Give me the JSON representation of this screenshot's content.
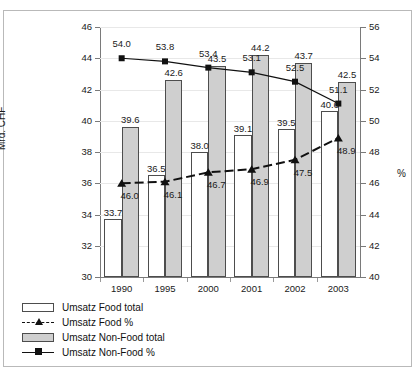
{
  "chart_data": {
    "type": "bar",
    "title": "",
    "subtitle": "",
    "categories": [
      "1990",
      "1995",
      "2000",
      "2001",
      "2002",
      "2003"
    ],
    "xlabel": "",
    "ylabel": "Mrd. CHF",
    "ylabel_right": "%",
    "ylim": [
      30,
      46
    ],
    "ylim_right": [
      40,
      56
    ],
    "yticks": [
      30,
      32,
      34,
      36,
      38,
      40,
      42,
      44,
      46
    ],
    "yticks_right": [
      40,
      42,
      44,
      46,
      48,
      50,
      52,
      54,
      56
    ],
    "grid": true,
    "legend_position": "below",
    "series": [
      {
        "name": "Umsatz Food total",
        "kind": "bar",
        "axis": "left",
        "fill": "#ffffff",
        "values": [
          33.7,
          36.5,
          38.0,
          39.1,
          39.5,
          40.6
        ],
        "labels": [
          "33.7",
          "36.5",
          "38.0",
          "39.1",
          "39.5",
          "40.6"
        ]
      },
      {
        "name": "Umsatz Non-Food total",
        "kind": "bar",
        "axis": "left",
        "fill": "#cfcfcf",
        "values": [
          39.6,
          42.6,
          43.5,
          44.2,
          43.7,
          42.5
        ],
        "labels": [
          "39.6",
          "42.6",
          "43.5",
          "44.2",
          "43.7",
          "42.5"
        ]
      },
      {
        "name": "Umsatz Food %",
        "kind": "line",
        "axis": "right",
        "marker": "triangle",
        "dash": true,
        "values": [
          46.0,
          46.1,
          46.7,
          46.9,
          47.5,
          48.9
        ],
        "labels": [
          "46.0",
          "46.1",
          "46.7",
          "46.9",
          "47.5",
          "48.9"
        ]
      },
      {
        "name": "Umsatz Non-Food %",
        "kind": "line",
        "axis": "right",
        "marker": "square",
        "dash": false,
        "values": [
          54.0,
          53.8,
          53.4,
          53.1,
          52.5,
          51.1
        ],
        "labels": [
          "54.0",
          "53.8",
          "53.4",
          "53.1",
          "52.5",
          "51.1"
        ]
      }
    ]
  },
  "legend": {
    "items": [
      {
        "label": "Umsatz Food total",
        "key": "box-white"
      },
      {
        "label": "Umsatz Food %",
        "key": "line-triangle-dashed"
      },
      {
        "label": "Umsatz Non-Food total",
        "key": "box-gray"
      },
      {
        "label": "Umsatz Non-Food %",
        "key": "line-square-solid"
      }
    ]
  },
  "axes": {
    "left_title": "Mrd. CHF",
    "right_title": "%"
  },
  "colors": {
    "bar_food": "#ffffff",
    "bar_nonfood": "#cfcfcf",
    "bar_border": "#4d4d4d",
    "line": "#111111",
    "axis": "#7a7a7a",
    "grid": "#e8e8e8",
    "frame": "#b9b9b9"
  }
}
